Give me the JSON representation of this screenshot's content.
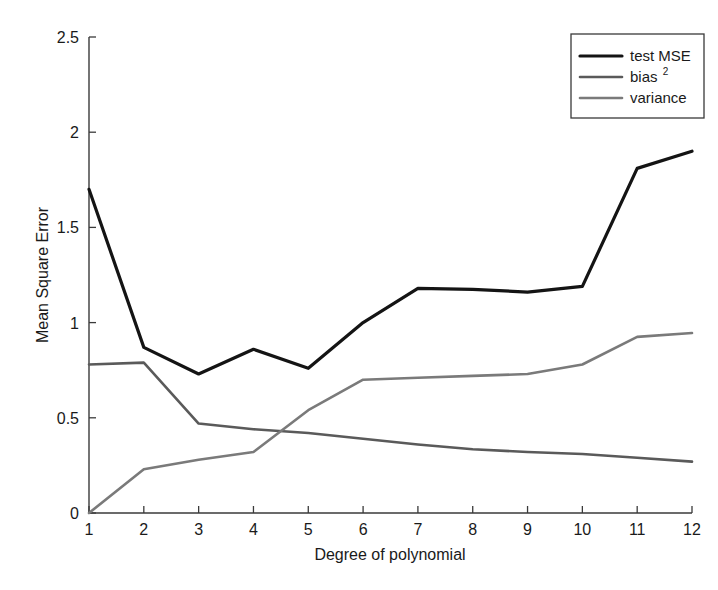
{
  "chart_data": {
    "type": "line",
    "title": "",
    "xlabel": "Degree of polynomial",
    "ylabel": "Mean Square Error",
    "xlim": [
      1,
      12
    ],
    "ylim": [
      0,
      2.5
    ],
    "xticks": [
      "1",
      "2",
      "3",
      "4",
      "5",
      "6",
      "7",
      "8",
      "9",
      "10",
      "11",
      "12"
    ],
    "yticks": [
      "0",
      "0.5",
      "1",
      "1.5",
      "2",
      "2.5"
    ],
    "x": [
      1,
      2,
      3,
      4,
      5,
      6,
      7,
      8,
      9,
      10,
      11,
      12
    ],
    "grid": false,
    "legend_position": "top-right",
    "series": [
      {
        "name": "test MSE",
        "color": "#141414",
        "width": 3.2,
        "values": [
          1.7,
          0.87,
          0.73,
          0.86,
          0.76,
          1.0,
          1.18,
          1.175,
          1.16,
          1.19,
          1.81,
          1.9
        ]
      },
      {
        "name": "bias",
        "superscript": "2",
        "color": "#5a5a5a",
        "width": 2.6,
        "values": [
          0.78,
          0.79,
          0.47,
          0.44,
          0.42,
          0.39,
          0.36,
          0.335,
          0.32,
          0.31,
          0.29,
          0.27
        ]
      },
      {
        "name": "variance",
        "color": "#7a7a7a",
        "width": 2.6,
        "values": [
          0.0,
          0.23,
          0.28,
          0.32,
          0.54,
          0.7,
          0.71,
          0.72,
          0.73,
          0.78,
          0.925,
          0.945
        ]
      }
    ]
  },
  "legend": {
    "entries": [
      {
        "label": "test MSE",
        "sup": ""
      },
      {
        "label": "bias",
        "sup": "2"
      },
      {
        "label": "variance",
        "sup": ""
      }
    ]
  },
  "axes": {
    "x_title": "Degree of polynomial",
    "y_title": "Mean Square Error",
    "x_tick_labels": [
      "1",
      "2",
      "3",
      "4",
      "5",
      "6",
      "7",
      "8",
      "9",
      "10",
      "11",
      "12"
    ],
    "y_tick_labels": [
      "0",
      "0.5",
      "1",
      "1.5",
      "2",
      "2.5"
    ]
  },
  "colors": {
    "background": "#ffffff",
    "axis": "#3a3a3a",
    "test_mse": "#141414",
    "bias_squared": "#5a5a5a",
    "variance": "#7a7a7a"
  }
}
